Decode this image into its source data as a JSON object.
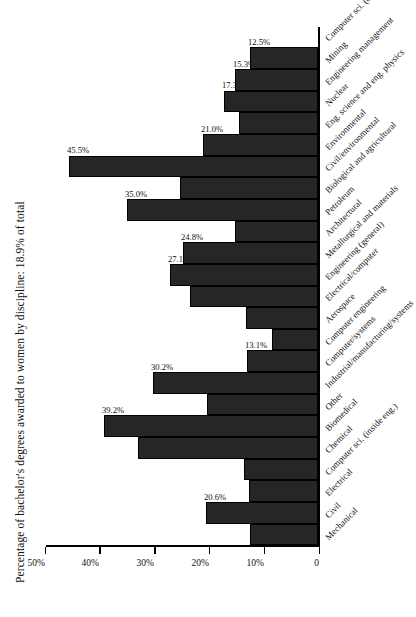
{
  "chart_data": {
    "type": "bar",
    "title": "Percentage of bachelor's degrees awarded to women by discipline: 18.9% of total",
    "subtitle": "",
    "xlabel": "",
    "ylabel": "",
    "orientation": "vertical",
    "grid": false,
    "legend": false,
    "ylim": [
      0,
      50
    ],
    "yticks": [
      0,
      10,
      20,
      30,
      40,
      50
    ],
    "ytick_labels": [
      "0",
      "10%",
      "20%",
      "30%",
      "40%",
      "50%"
    ],
    "bar_color": "#262626",
    "categories": [
      "Mechanical",
      "Civil",
      "Electrical",
      "Computer sci. (inside eng.)",
      "Chemical",
      "Biomedical",
      "Other",
      "Industrial/manufacturing/systems",
      "Computer/systems",
      "Computer engineering",
      "Aerospace",
      "Electrical/computer",
      "Engineering (general)",
      "Metallurgical and materials",
      "Architectural",
      "Petroleum",
      "Biological and agricultural",
      "Civil/environmental",
      "Environmental",
      "Eng. science and eng. physics",
      "Nuclear",
      "Engineering management",
      "Mining",
      "Computer sci. (outside eng.)"
    ],
    "values": [
      12.4,
      20.6,
      12.7,
      13.6,
      32.9,
      39.2,
      20.3,
      30.2,
      13.1,
      8.5,
      13.2,
      23.4,
      27.1,
      24.8,
      15.3,
      35.0,
      25.3,
      45.5,
      21.0,
      14.5,
      17.3,
      15.3,
      12.5,
      null
    ],
    "value_labels": [
      "12.4%",
      "20.6%",
      "12.7%",
      "13.6%",
      "32.9%",
      "39.2%",
      "20.3%",
      "30.2%",
      "13.1%",
      "8.5%",
      "13.2%",
      "23.4%",
      "27.1%",
      "24.8%",
      "15.3%",
      "35.0%",
      "25.3%",
      "45.5%",
      "21.0%",
      "14.5%",
      "17.3%",
      "15.3%",
      "12.5%",
      ""
    ]
  }
}
